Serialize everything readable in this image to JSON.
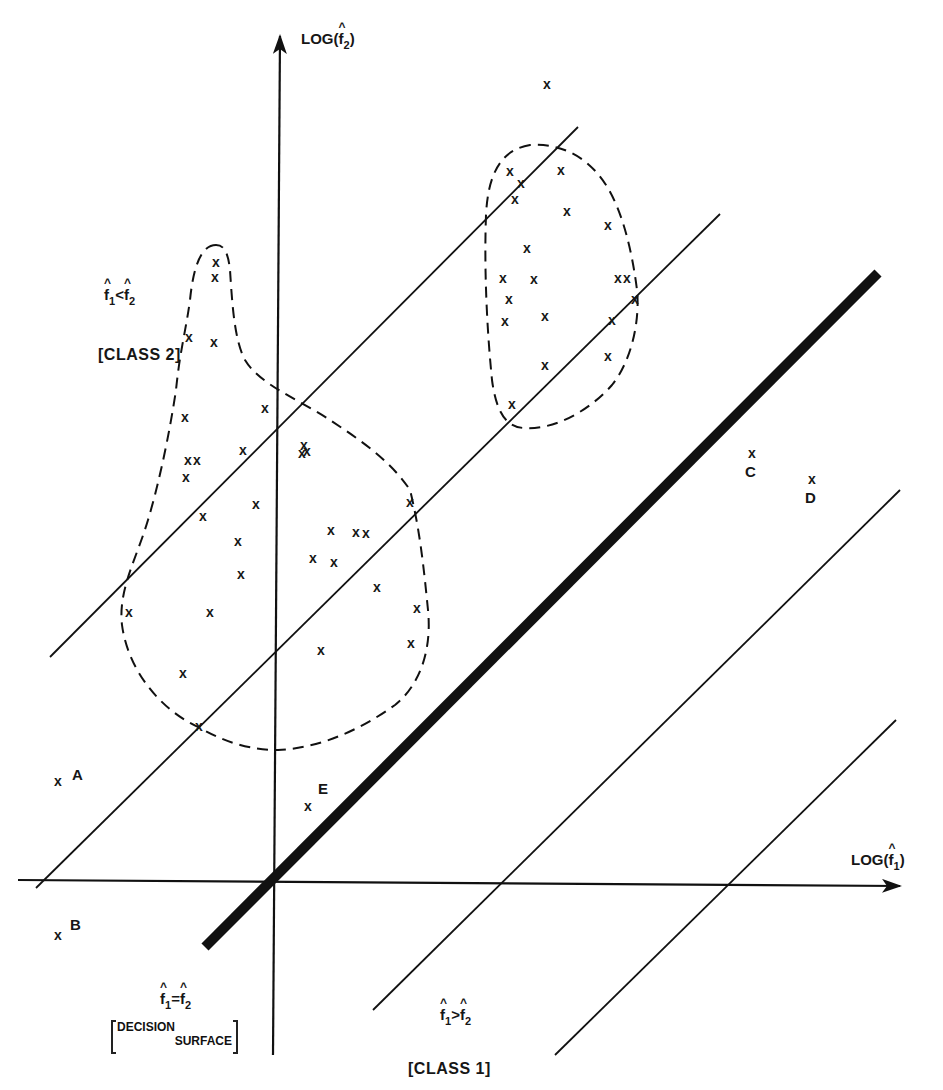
{
  "figure": {
    "type": "feature-space decision diagram",
    "x_axis": {
      "label": "LOG(f̂1)",
      "text": "LOG(",
      "var": "f",
      "sub": "1",
      "close": ")"
    },
    "y_axis": {
      "label": "LOG(f̂2)",
      "text": "LOG(",
      "var": "f",
      "sub": "2",
      "close": ")"
    },
    "regions": {
      "class2": {
        "condition": "f̂1 < f̂2",
        "var1": "f",
        "sub1": "1",
        "op": "<",
        "var2": "f",
        "sub2": "2",
        "label": "[CLASS 2]"
      },
      "class1": {
        "condition": "f̂1 > f̂2",
        "var1": "f",
        "sub1": "1",
        "op": ">",
        "var2": "f",
        "sub2": "2",
        "label": "[CLASS 1]"
      },
      "decision_surface": {
        "condition": "f̂1 = f̂2",
        "var1": "f",
        "sub1": "1",
        "op": "=",
        "var2": "f",
        "sub2": "2",
        "line1": "DECISION",
        "line2": "SURFACE"
      }
    },
    "labeled_points": [
      {
        "name": "A",
        "x": 58,
        "y": 781
      },
      {
        "name": "B",
        "x": 58,
        "y": 935
      },
      {
        "name": "C",
        "x": 752,
        "y": 453
      },
      {
        "name": "D",
        "x": 812,
        "y": 479
      },
      {
        "name": "E",
        "x": 308,
        "y": 806
      }
    ],
    "marker": "x",
    "clusters": [
      {
        "name": "left-cluster",
        "points": [
          [
            216,
            262
          ],
          [
            215,
            277
          ],
          [
            189,
            337
          ],
          [
            214,
            342
          ],
          [
            265,
            408
          ],
          [
            185,
            417
          ],
          [
            188,
            460
          ],
          [
            197,
            460
          ],
          [
            243,
            450
          ],
          [
            186,
            477
          ],
          [
            304,
            445
          ],
          [
            302,
            453
          ],
          [
            307,
            451
          ],
          [
            410,
            502
          ],
          [
            203,
            516
          ],
          [
            256,
            504
          ],
          [
            238,
            541
          ],
          [
            331,
            530
          ],
          [
            356,
            532
          ],
          [
            366,
            533
          ],
          [
            241,
            574
          ],
          [
            313,
            558
          ],
          [
            334,
            562
          ],
          [
            377,
            587
          ],
          [
            129,
            612
          ],
          [
            210,
            612
          ],
          [
            417,
            608
          ],
          [
            411,
            643
          ],
          [
            321,
            650
          ],
          [
            183,
            673
          ],
          [
            199,
            726
          ]
        ]
      },
      {
        "name": "right-cluster",
        "points": [
          [
            547,
            84
          ],
          [
            510,
            171
          ],
          [
            521,
            183
          ],
          [
            561,
            170
          ],
          [
            515,
            199
          ],
          [
            567,
            211
          ],
          [
            608,
            225
          ],
          [
            527,
            248
          ],
          [
            503,
            278
          ],
          [
            534,
            279
          ],
          [
            618,
            278
          ],
          [
            627,
            278
          ],
          [
            509,
            299
          ],
          [
            505,
            321
          ],
          [
            545,
            316
          ],
          [
            612,
            320
          ],
          [
            635,
            299
          ],
          [
            608,
            356
          ],
          [
            545,
            365
          ],
          [
            512,
            404
          ]
        ]
      }
    ]
  }
}
